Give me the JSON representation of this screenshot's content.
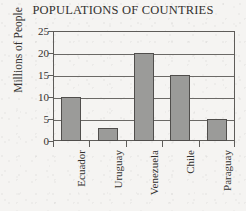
{
  "chart_data": {
    "type": "bar",
    "title": "POPULATIONS OF COUNTRIES",
    "xlabel": "",
    "ylabel": "Millions of People",
    "categories": [
      "Ecuador",
      "Uruguay",
      "Venezuela",
      "Chile",
      "Paraguay"
    ],
    "values": [
      10,
      3,
      20,
      15,
      5
    ],
    "ylim": [
      0,
      25
    ],
    "ytick_labels": [
      "0",
      "5",
      "10",
      "15",
      "20",
      "25"
    ],
    "ytick_values": [
      0,
      5,
      10,
      15,
      20,
      25
    ],
    "grid": "horizontal",
    "legend": "none",
    "bar_color": "#9b9b99",
    "bar_border_color": "#504e4c",
    "axis_color": "#5e5c59",
    "text_color": "#33312f",
    "background_color": "#f5f4f2"
  }
}
